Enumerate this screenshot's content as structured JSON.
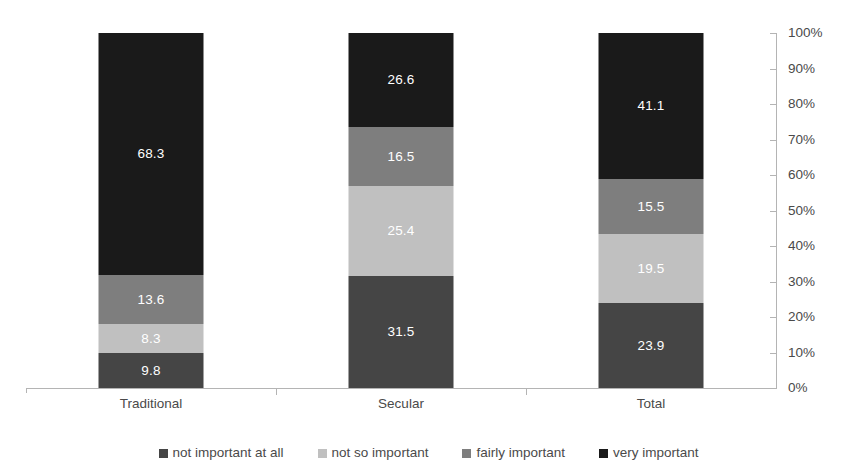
{
  "chart_data": {
    "type": "bar",
    "subtype": "stacked-bar-100-percent",
    "title": "",
    "subtitle": "",
    "xlabel": "",
    "ylabel": "",
    "categories": [
      "Traditional",
      "Secular",
      "Total"
    ],
    "series": [
      {
        "name": "not important at all",
        "color": "#454545",
        "values": [
          9.8,
          31.5,
          23.9
        ]
      },
      {
        "name": "not so important",
        "color": "#c0c0c0",
        "values": [
          8.3,
          25.4,
          19.5
        ]
      },
      {
        "name": "fairly important",
        "color": "#7e7e7e",
        "values": [
          13.6,
          16.5,
          15.5
        ]
      },
      {
        "name": "very important",
        "color": "#1a1a1a",
        "values": [
          68.3,
          26.6,
          41.1
        ]
      }
    ],
    "stack_order": "bottom-to-top",
    "data_labels": {
      "Traditional": [
        "9.8",
        "8.3",
        "13.6",
        "68.3"
      ],
      "Secular": [
        "31.5",
        "25.4",
        "16.5",
        "26.6"
      ],
      "Total": [
        "23.9",
        "19.5",
        "15.5",
        "41.1"
      ]
    },
    "ylim": [
      0,
      100
    ],
    "y_tick_labels": [
      "0%",
      "10%",
      "20%",
      "30%",
      "40%",
      "50%",
      "60%",
      "70%",
      "80%",
      "90%",
      "100%"
    ],
    "y_tick_values": [
      0,
      10,
      20,
      30,
      40,
      50,
      60,
      70,
      80,
      90,
      100
    ],
    "y_axis_position": "right",
    "grid": false,
    "legend_position": "bottom",
    "annotations": []
  },
  "axis": {
    "y_labels": [
      "100%",
      "90%",
      "80%",
      "70%",
      "60%",
      "50%",
      "40%",
      "30%",
      "20%",
      "10%",
      "0%"
    ],
    "x_labels": [
      "Traditional",
      "Secular",
      "Total"
    ]
  },
  "legend": {
    "items": [
      {
        "label": "not important at all",
        "color": "#454545"
      },
      {
        "label": "not so important",
        "color": "#c0c0c0"
      },
      {
        "label": "fairly important",
        "color": "#7e7e7e"
      },
      {
        "label": "very important",
        "color": "#1a1a1a"
      }
    ]
  }
}
